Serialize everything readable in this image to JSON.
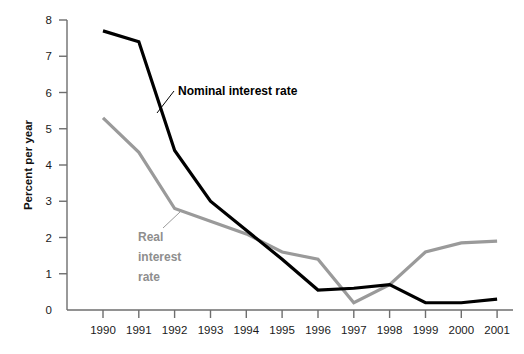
{
  "chart_data": {
    "type": "line",
    "title": "",
    "xlabel": "",
    "ylabel": "Percent per year",
    "x": [
      1990,
      1991,
      1992,
      1993,
      1994,
      1995,
      1996,
      1997,
      1998,
      1999,
      2000,
      2001
    ],
    "xtick_labels": [
      "1990",
      "1991",
      "1992",
      "1993",
      "1994",
      "1995",
      "1996",
      "1997",
      "1998",
      "1999",
      "2000",
      "2001"
    ],
    "ytick_labels": [
      "0",
      "1",
      "2",
      "3",
      "4",
      "5",
      "6",
      "7",
      "8"
    ],
    "yticks": [
      0,
      1,
      2,
      3,
      4,
      5,
      6,
      7,
      8
    ],
    "ylim": [
      0,
      8
    ],
    "xlim": [
      1990,
      2001
    ],
    "grid": false,
    "legend_position": "inline-annotations",
    "series": [
      {
        "name": "Nominal interest rate",
        "color": "#000000",
        "values": [
          7.7,
          7.4,
          4.4,
          3.0,
          2.2,
          1.4,
          0.55,
          0.6,
          0.7,
          0.2,
          0.2,
          0.3
        ]
      },
      {
        "name": "Real interest rate",
        "color": "#9a9a9a",
        "values": [
          5.3,
          4.35,
          2.8,
          2.45,
          2.1,
          1.6,
          1.4,
          0.2,
          0.7,
          1.6,
          1.85,
          1.9
        ]
      }
    ],
    "annotations": [
      {
        "text": "Nominal interest rate",
        "color": "#000000",
        "x": 177,
        "y": 95
      },
      {
        "text_lines": [
          "Real",
          "interest",
          "rate"
        ],
        "color": "#8e8e8e",
        "x": 139,
        "y": 241
      }
    ]
  }
}
